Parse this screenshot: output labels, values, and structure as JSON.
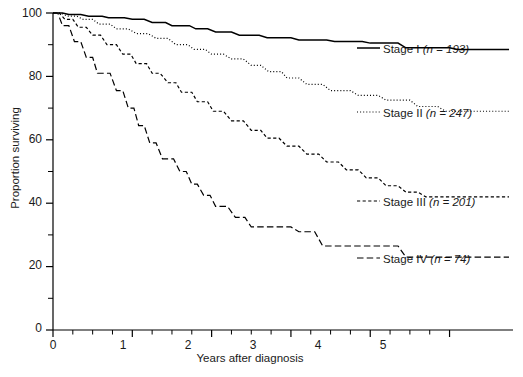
{
  "chart_data": {
    "type": "line",
    "title": "",
    "subtitle": "",
    "xlabel": "Years after diagnosis",
    "ylabel": "Proportion surviving",
    "xlim": [
      0,
      5.8
    ],
    "ylim": [
      0,
      100
    ],
    "xticks": [
      0,
      1,
      2,
      3,
      4,
      5
    ],
    "xtick_labels": [
      "0",
      "1",
      "2",
      "3",
      "4",
      "5"
    ],
    "yticks": [
      0,
      20,
      40,
      60,
      80,
      100
    ],
    "ytick_labels": [
      "0",
      "20",
      "40",
      "60",
      "80",
      "100"
    ],
    "y_minor_ticks": [
      10,
      30,
      50,
      70,
      90
    ],
    "x_minor_ticks": [
      0.25,
      0.5,
      0.75,
      1.25,
      1.5,
      1.75,
      2.25,
      2.5,
      2.75,
      3.25,
      3.5,
      3.75,
      4.25,
      4.5,
      4.75
    ],
    "grid": false,
    "legend_position": "right",
    "series": [
      {
        "name": "Stage I",
        "n": 193,
        "legend_label": "Stage I",
        "legend_n": "(n = 193)",
        "line_style": "solid",
        "color": "#000000",
        "points": [
          [
            0.0,
            100
          ],
          [
            0.12,
            100
          ],
          [
            0.2,
            99.5
          ],
          [
            0.35,
            99.5
          ],
          [
            0.45,
            99.0
          ],
          [
            0.62,
            99.0
          ],
          [
            0.7,
            98.5
          ],
          [
            0.9,
            98.5
          ],
          [
            1.0,
            98.0
          ],
          [
            1.15,
            98.0
          ],
          [
            1.25,
            97.0
          ],
          [
            1.42,
            97.0
          ],
          [
            1.5,
            96.0
          ],
          [
            1.72,
            96.0
          ],
          [
            1.8,
            95.0
          ],
          [
            1.95,
            95.0
          ],
          [
            2.05,
            94.0
          ],
          [
            2.25,
            94.0
          ],
          [
            2.35,
            93.0
          ],
          [
            2.6,
            93.0
          ],
          [
            2.7,
            92.2
          ],
          [
            3.0,
            92.2
          ],
          [
            3.1,
            91.5
          ],
          [
            3.45,
            91.5
          ],
          [
            3.55,
            91.0
          ],
          [
            3.9,
            91.0
          ],
          [
            4.0,
            90.5
          ],
          [
            4.35,
            90.5
          ],
          [
            4.45,
            89.0
          ],
          [
            5.0,
            89.0
          ],
          [
            5.1,
            88.5
          ],
          [
            5.75,
            88.5
          ]
        ]
      },
      {
        "name": "Stage II",
        "n": 247,
        "legend_label": "Stage II",
        "legend_n": "(n = 247)",
        "line_style": "dotted",
        "color": "#000000",
        "points": [
          [
            0.0,
            100
          ],
          [
            0.1,
            100
          ],
          [
            0.18,
            99.0
          ],
          [
            0.3,
            99.0
          ],
          [
            0.38,
            98.0
          ],
          [
            0.5,
            98.0
          ],
          [
            0.58,
            96.5
          ],
          [
            0.72,
            96.5
          ],
          [
            0.8,
            95.0
          ],
          [
            0.95,
            95.0
          ],
          [
            1.05,
            93.5
          ],
          [
            1.2,
            93.5
          ],
          [
            1.3,
            92.0
          ],
          [
            1.45,
            92.0
          ],
          [
            1.55,
            90.0
          ],
          [
            1.7,
            90.0
          ],
          [
            1.78,
            88.5
          ],
          [
            1.92,
            88.5
          ],
          [
            2.0,
            87.0
          ],
          [
            2.15,
            87.0
          ],
          [
            2.25,
            85.5
          ],
          [
            2.4,
            85.5
          ],
          [
            2.5,
            83.5
          ],
          [
            2.62,
            83.5
          ],
          [
            2.72,
            81.5
          ],
          [
            2.88,
            81.5
          ],
          [
            2.95,
            79.5
          ],
          [
            3.1,
            79.5
          ],
          [
            3.2,
            77.5
          ],
          [
            3.4,
            77.5
          ],
          [
            3.5,
            75.5
          ],
          [
            3.75,
            75.5
          ],
          [
            3.85,
            74.0
          ],
          [
            4.1,
            74.0
          ],
          [
            4.2,
            72.5
          ],
          [
            4.5,
            72.5
          ],
          [
            4.6,
            70.5
          ],
          [
            4.85,
            70.5
          ],
          [
            4.95,
            69.0
          ],
          [
            5.75,
            69.0
          ]
        ]
      },
      {
        "name": "Stage III",
        "n": 201,
        "legend_label": "Stage III",
        "legend_n": "(n = 201)",
        "line_style": "dashed-short",
        "color": "#000000",
        "points": [
          [
            0.0,
            100
          ],
          [
            0.08,
            100
          ],
          [
            0.15,
            98.0
          ],
          [
            0.25,
            98.0
          ],
          [
            0.32,
            95.5
          ],
          [
            0.42,
            95.5
          ],
          [
            0.5,
            93.0
          ],
          [
            0.6,
            93.0
          ],
          [
            0.68,
            90.0
          ],
          [
            0.8,
            90.0
          ],
          [
            0.88,
            87.0
          ],
          [
            0.98,
            87.0
          ],
          [
            1.05,
            84.0
          ],
          [
            1.18,
            84.0
          ],
          [
            1.25,
            81.0
          ],
          [
            1.35,
            81.0
          ],
          [
            1.45,
            78.0
          ],
          [
            1.55,
            78.0
          ],
          [
            1.62,
            75.0
          ],
          [
            1.75,
            75.0
          ],
          [
            1.82,
            72.0
          ],
          [
            1.95,
            72.0
          ],
          [
            2.02,
            69.0
          ],
          [
            2.15,
            69.0
          ],
          [
            2.25,
            66.0
          ],
          [
            2.4,
            66.0
          ],
          [
            2.5,
            63.0
          ],
          [
            2.62,
            63.0
          ],
          [
            2.7,
            60.5
          ],
          [
            2.85,
            60.5
          ],
          [
            2.95,
            58.0
          ],
          [
            3.1,
            58.0
          ],
          [
            3.2,
            55.5
          ],
          [
            3.35,
            55.5
          ],
          [
            3.45,
            53.0
          ],
          [
            3.6,
            53.0
          ],
          [
            3.7,
            50.5
          ],
          [
            3.85,
            50.5
          ],
          [
            3.95,
            48.0
          ],
          [
            4.1,
            48.0
          ],
          [
            4.2,
            45.5
          ],
          [
            4.35,
            45.5
          ],
          [
            4.45,
            43.5
          ],
          [
            4.6,
            43.5
          ],
          [
            4.7,
            42.0
          ],
          [
            5.75,
            42.0
          ]
        ]
      },
      {
        "name": "Stage IV",
        "n": 74,
        "legend_label": "Stage IV",
        "legend_n": "(n = 74)",
        "line_style": "dashed-long",
        "color": "#000000",
        "points": [
          [
            0.0,
            100
          ],
          [
            0.06,
            100
          ],
          [
            0.12,
            96.0
          ],
          [
            0.2,
            96.0
          ],
          [
            0.27,
            91.0
          ],
          [
            0.35,
            91.0
          ],
          [
            0.42,
            86.0
          ],
          [
            0.5,
            86.0
          ],
          [
            0.56,
            81.0
          ],
          [
            0.72,
            81.0
          ],
          [
            0.8,
            75.5
          ],
          [
            0.88,
            75.5
          ],
          [
            0.95,
            70.0
          ],
          [
            1.02,
            70.0
          ],
          [
            1.08,
            64.5
          ],
          [
            1.15,
            64.5
          ],
          [
            1.22,
            59.0
          ],
          [
            1.3,
            59.0
          ],
          [
            1.38,
            54.0
          ],
          [
            1.52,
            54.0
          ],
          [
            1.6,
            50.0
          ],
          [
            1.68,
            50.0
          ],
          [
            1.75,
            46.0
          ],
          [
            1.82,
            46.0
          ],
          [
            1.9,
            42.5
          ],
          [
            1.98,
            42.5
          ],
          [
            2.05,
            39.0
          ],
          [
            2.2,
            39.0
          ],
          [
            2.3,
            35.5
          ],
          [
            2.42,
            35.5
          ],
          [
            2.5,
            32.5
          ],
          [
            3.0,
            32.5
          ],
          [
            3.1,
            31.0
          ],
          [
            3.3,
            31.0
          ],
          [
            3.4,
            26.5
          ],
          [
            4.35,
            26.5
          ],
          [
            4.45,
            23.0
          ],
          [
            5.75,
            23.0
          ]
        ]
      }
    ]
  },
  "axes": {
    "ylabel": "Proportion surviving",
    "xlabel": "Years after diagnosis"
  },
  "legend": {
    "items": [
      {
        "label": "Stage I",
        "n_text": "(n = 193)"
      },
      {
        "label": "Stage II",
        "n_text": "(n = 247)"
      },
      {
        "label": "Stage III",
        "n_text": "(n = 201)"
      },
      {
        "label": "Stage IV",
        "n_text": "(n = 74)"
      }
    ]
  },
  "ticks": {
    "y": [
      "100",
      "80",
      "60",
      "40",
      "20",
      "0"
    ],
    "x": [
      "0",
      "1",
      "2",
      "3",
      "4",
      "5"
    ]
  }
}
